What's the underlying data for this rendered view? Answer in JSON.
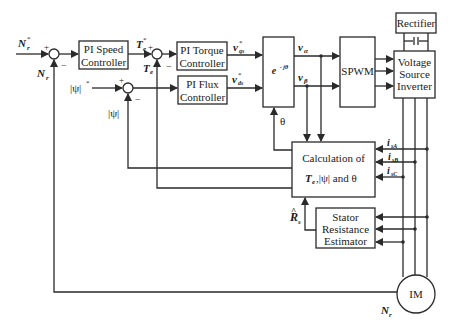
{
  "diagram": {
    "blocks": {
      "pi_speed": {
        "line1": "PI Speed",
        "line2": "Controller"
      },
      "pi_torque": {
        "line1": "PI Torque",
        "line2": "Controller"
      },
      "pi_flux": {
        "line1": "PI Flux",
        "line2": "Controller"
      },
      "transform": {
        "label": "e^-jθ",
        "base": "e",
        "sup": "- jθ"
      },
      "spwm": {
        "label": "SPWM"
      },
      "rectifier": {
        "label": "Rectifier"
      },
      "vsi": {
        "line1": "Voltage",
        "line2": "Source",
        "line3": "Inverter"
      },
      "calculation": {
        "line1": "Calculation of",
        "line2_a": "T",
        "line2_a_sub": "e",
        "line2_b": " ,|ψ| and θ"
      },
      "estimator": {
        "line1": "Stator",
        "line2": "Resistance",
        "line3": "Estimator"
      },
      "motor": {
        "label": "IM"
      }
    },
    "signals": {
      "speed_ref": {
        "base": "N",
        "sub": "r",
        "sup": "*"
      },
      "speed_fb": {
        "base": "N",
        "sub": "r"
      },
      "speed_motor": {
        "base": "N",
        "sub": "r"
      },
      "torque_ref": {
        "base": "T",
        "sub": "e",
        "sup": "*"
      },
      "torque_fb": {
        "base": "T",
        "sub": "e"
      },
      "flux_ref": {
        "label": "|ψ|",
        "sup": "*"
      },
      "flux_fb": {
        "label": "|ψ|"
      },
      "vq_ref": {
        "base": "v",
        "sub": "qs",
        "sup": "*"
      },
      "vd_ref": {
        "base": "v",
        "sub": "ds",
        "sup": "*"
      },
      "v_alpha": {
        "base": "v",
        "sub": "α"
      },
      "v_beta": {
        "base": "v",
        "sub": "β"
      },
      "theta": {
        "label": "θ"
      },
      "isA": {
        "base": "i",
        "sub": "sA"
      },
      "isB": {
        "base": "i",
        "sub": "sB"
      },
      "isC": {
        "base": "i",
        "sub": "sC"
      },
      "rs_hat": {
        "base": "R",
        "sub": "s",
        "hat": "^"
      }
    },
    "sum_signs": {
      "plus": "+",
      "minus": "−"
    }
  }
}
